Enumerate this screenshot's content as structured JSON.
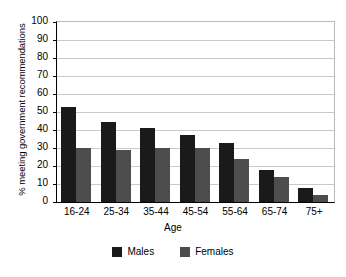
{
  "chart_data": {
    "type": "bar",
    "title": "",
    "xlabel": "Age",
    "ylabel": "% meeting government recommendations",
    "categories": [
      "16-24",
      "25-34",
      "35-44",
      "45-54",
      "55-64",
      "65-74",
      "75+"
    ],
    "series": [
      {
        "name": "Males",
        "color": "#1a1a1a",
        "values": [
          53,
          44.5,
          41,
          37.5,
          33,
          18,
          8
        ]
      },
      {
        "name": "Females",
        "color": "#4d4d4d",
        "values": [
          30,
          29,
          30,
          30,
          24,
          14,
          4
        ]
      }
    ],
    "ylim": [
      0,
      100
    ],
    "yticks": [
      0,
      10,
      20,
      30,
      40,
      50,
      60,
      70,
      80,
      90,
      100
    ],
    "ytick_labels": [
      "0",
      "10",
      "20",
      "30",
      "40",
      "50",
      "60",
      "70",
      "80",
      "90",
      "100"
    ],
    "grid": true,
    "legend_position": "bottom"
  }
}
